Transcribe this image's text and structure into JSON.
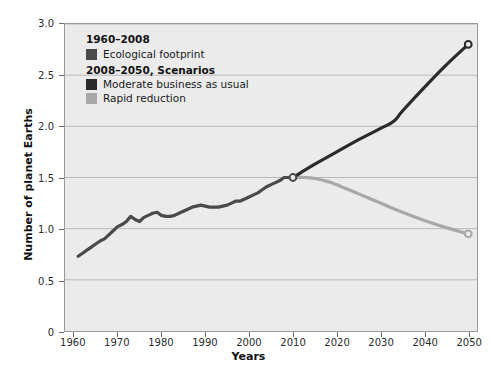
{
  "chart_data": {
    "type": "line",
    "title": "",
    "xlabel": "Years",
    "ylabel": "Number of planet Earths",
    "xlim": [
      1958,
      2052
    ],
    "ylim": [
      0,
      3.0
    ],
    "grid": true,
    "legend_position": "top-left inside plot",
    "xticks": [
      "1960",
      "1970",
      "1980",
      "1990",
      "2000",
      "2010",
      "2020",
      "2030",
      "2040",
      "2050"
    ],
    "xtick_values": [
      1960,
      1970,
      1980,
      1990,
      2000,
      2010,
      2020,
      2030,
      2040,
      2050
    ],
    "yticks": [
      "0",
      "0.5",
      "1.0",
      "1.5",
      "2.0",
      "2.5",
      "3.0"
    ],
    "ytick_values": [
      0,
      0.5,
      1.0,
      1.5,
      2.0,
      2.5,
      3.0
    ],
    "colors": {
      "historical": "#4a4a4a",
      "moderate": "#2b2b2b",
      "rapid": "#a8a8a8",
      "plot_background": "#ebebeb",
      "gridline": "#b9b9b9",
      "frame": "#9a9a9a"
    },
    "series": [
      {
        "name": "Ecological footprint",
        "period": "1960-2008",
        "color": "#4a4a4a",
        "x": [
          1961,
          1962,
          1963,
          1964,
          1965,
          1966,
          1967,
          1968,
          1969,
          1970,
          1971,
          1972,
          1973,
          1974,
          1975,
          1976,
          1977,
          1978,
          1979,
          1980,
          1981,
          1982,
          1983,
          1984,
          1985,
          1986,
          1987,
          1988,
          1989,
          1990,
          1991,
          1992,
          1993,
          1994,
          1995,
          1996,
          1997,
          1998,
          1999,
          2000,
          2001,
          2002,
          2003,
          2004,
          2005,
          2006,
          2007,
          2008,
          2010
        ],
        "values": [
          0.73,
          0.76,
          0.79,
          0.82,
          0.85,
          0.88,
          0.9,
          0.94,
          0.98,
          1.02,
          1.04,
          1.07,
          1.12,
          1.09,
          1.07,
          1.11,
          1.13,
          1.15,
          1.16,
          1.13,
          1.12,
          1.12,
          1.13,
          1.15,
          1.17,
          1.19,
          1.21,
          1.22,
          1.23,
          1.22,
          1.21,
          1.21,
          1.21,
          1.22,
          1.23,
          1.25,
          1.27,
          1.27,
          1.29,
          1.31,
          1.33,
          1.35,
          1.38,
          1.41,
          1.43,
          1.45,
          1.47,
          1.5,
          1.5
        ]
      },
      {
        "name": "Moderate business as usual",
        "period": "2008-2050",
        "color": "#2b2b2b",
        "x": [
          2010,
          2015,
          2020,
          2025,
          2030,
          2033,
          2035,
          2040,
          2045,
          2050
        ],
        "values": [
          1.5,
          1.63,
          1.75,
          1.87,
          1.98,
          2.05,
          2.15,
          2.38,
          2.6,
          2.8
        ]
      },
      {
        "name": "Rapid reduction",
        "period": "2008-2050",
        "color": "#a8a8a8",
        "x": [
          2010,
          2013,
          2015,
          2018,
          2020,
          2025,
          2030,
          2035,
          2040,
          2045,
          2050
        ],
        "values": [
          1.5,
          1.5,
          1.49,
          1.46,
          1.43,
          1.34,
          1.25,
          1.16,
          1.08,
          1.01,
          0.95
        ]
      }
    ],
    "markers": [
      {
        "name": "branch-point",
        "x": 2010,
        "y": 1.5,
        "style": "open-circle"
      },
      {
        "name": "moderate-endpoint",
        "x": 2050,
        "y": 2.8,
        "style": "open-circle"
      },
      {
        "name": "rapid-endpoint",
        "x": 2050,
        "y": 0.95,
        "style": "open-circle"
      }
    ]
  },
  "axes": {
    "y_title": "Number of planet Earths",
    "x_title": "Years"
  },
  "legend": {
    "groups": [
      {
        "heading": "1960–2008",
        "items": [
          {
            "label": "Ecological footprint",
            "color": "#4a4a4a"
          }
        ]
      },
      {
        "heading": "2008–2050, Scenarios",
        "items": [
          {
            "label": "Moderate business as usual",
            "color": "#2b2b2b"
          },
          {
            "label": "Rapid reduction",
            "color": "#a8a8a8"
          }
        ]
      }
    ]
  }
}
